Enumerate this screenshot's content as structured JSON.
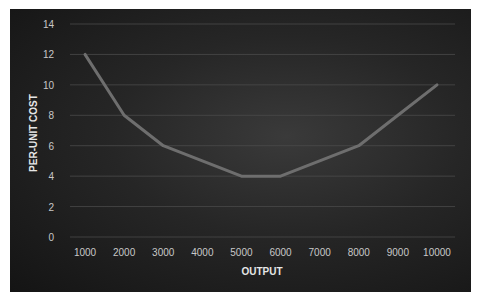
{
  "chart_data": {
    "type": "line",
    "title": "",
    "xlabel": "OUTPUT",
    "ylabel": "PER-UNIT COST",
    "categories": [
      "1000",
      "2000",
      "3000",
      "4000",
      "5000",
      "6000",
      "7000",
      "8000",
      "9000",
      "10000"
    ],
    "series": [
      {
        "name": "Per-unit cost",
        "values": [
          12,
          8,
          6,
          5,
          4,
          4,
          5,
          6,
          8,
          10
        ],
        "color": "#6e6e6e"
      }
    ],
    "ylim": [
      0,
      14
    ],
    "yticks": [
      0,
      2,
      4,
      6,
      8,
      10,
      12,
      14
    ],
    "grid": true,
    "legend": "none",
    "background": "#1e1e1e"
  },
  "labels": {
    "x_title": "OUTPUT",
    "y_title": "PER-UNIT COST"
  }
}
